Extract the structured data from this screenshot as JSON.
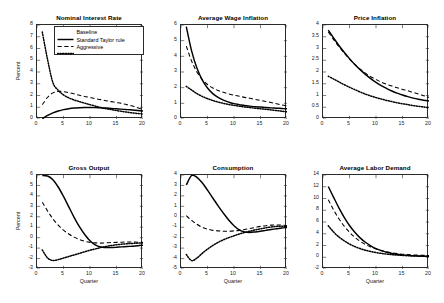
{
  "figure": {
    "background": "#ffffff",
    "line_color": "#000000",
    "axis_color": "#2b2b2b"
  },
  "legend": {
    "position": "top-right-of-panel-1",
    "entries": [
      {
        "label": "Baseline",
        "style": "solid"
      },
      {
        "label": "Standard Taylor rule",
        "style": "dashed"
      },
      {
        "label": "Aggressive",
        "style": "dotted"
      }
    ]
  },
  "axis_labels": {
    "y": "Percent",
    "x": "Quarter"
  },
  "chart_data": [
    {
      "type": "line",
      "title": "Nominal Interest Rate",
      "xlabel": "",
      "ylabel": "Percent",
      "xlim": [
        0,
        20
      ],
      "ylim": [
        0,
        8
      ],
      "xticks": [
        0,
        5,
        10,
        15,
        20
      ],
      "yticks": [
        0,
        1,
        2,
        3,
        4,
        5,
        6,
        7,
        8
      ],
      "grid": false,
      "x": [
        1,
        2,
        3,
        4,
        5,
        6,
        7,
        8,
        9,
        10,
        11,
        12,
        13,
        14,
        15,
        16,
        17,
        18,
        19,
        20
      ],
      "series": [
        {
          "name": "Baseline",
          "style": "solid",
          "values": [
            0.02,
            0.3,
            0.52,
            0.68,
            0.8,
            0.88,
            0.93,
            0.96,
            0.98,
            0.98,
            0.97,
            0.95,
            0.93,
            0.9,
            0.87,
            0.84,
            0.8,
            0.76,
            0.72,
            0.68
          ]
        },
        {
          "name": "Standard Taylor rule",
          "style": "dashed",
          "values": [
            1.22,
            1.85,
            2.22,
            2.35,
            2.33,
            2.25,
            2.14,
            2.02,
            1.92,
            1.83,
            1.73,
            1.65,
            1.56,
            1.48,
            1.4,
            1.32,
            1.22,
            1.1,
            0.95,
            0.8
          ]
        },
        {
          "name": "Aggressive",
          "style": "dotted",
          "values": [
            7.4,
            5.05,
            3.1,
            2.45,
            2.05,
            1.8,
            1.62,
            1.48,
            1.35,
            1.22,
            1.1,
            0.98,
            0.88,
            0.8,
            0.72,
            0.65,
            0.58,
            0.52,
            0.47,
            0.43
          ]
        }
      ]
    },
    {
      "type": "line",
      "title": "Average Wage Inflation",
      "xlabel": "",
      "ylabel": "",
      "xlim": [
        0,
        20
      ],
      "ylim": [
        0,
        6
      ],
      "xticks": [
        0,
        5,
        10,
        15,
        20
      ],
      "yticks": [
        0,
        1,
        2,
        3,
        4,
        5,
        6
      ],
      "grid": false,
      "x": [
        1,
        2,
        3,
        4,
        5,
        6,
        7,
        8,
        9,
        10,
        11,
        12,
        13,
        14,
        15,
        16,
        17,
        18,
        19,
        20
      ],
      "series": [
        {
          "name": "Baseline",
          "style": "solid",
          "values": [
            5.9,
            4.35,
            3.25,
            2.5,
            1.98,
            1.62,
            1.38,
            1.2,
            1.08,
            0.98,
            0.92,
            0.86,
            0.82,
            0.78,
            0.76,
            0.73,
            0.71,
            0.69,
            0.67,
            0.65
          ]
        },
        {
          "name": "Standard Taylor rule",
          "style": "dashed",
          "values": [
            4.65,
            3.7,
            3.0,
            2.52,
            2.2,
            1.98,
            1.82,
            1.7,
            1.6,
            1.52,
            1.45,
            1.38,
            1.32,
            1.25,
            1.18,
            1.12,
            1.05,
            0.98,
            0.9,
            0.82
          ]
        },
        {
          "name": "Aggressive",
          "style": "dotted",
          "values": [
            2.08,
            1.85,
            1.62,
            1.44,
            1.3,
            1.18,
            1.08,
            1.0,
            0.93,
            0.87,
            0.82,
            0.77,
            0.73,
            0.69,
            0.65,
            0.62,
            0.58,
            0.54,
            0.5,
            0.46
          ]
        }
      ]
    },
    {
      "type": "line",
      "title": "Price Inflation",
      "xlabel": "",
      "ylabel": "",
      "xlim": [
        0,
        20
      ],
      "ylim": [
        0,
        4
      ],
      "xticks": [
        0,
        5,
        10,
        15,
        20
      ],
      "yticks": [
        0,
        0.5,
        1,
        1.5,
        2,
        2.5,
        3,
        3.5,
        4
      ],
      "grid": false,
      "x": [
        1,
        2,
        3,
        4,
        5,
        6,
        7,
        8,
        9,
        10,
        11,
        12,
        13,
        14,
        15,
        16,
        17,
        18,
        19,
        20
      ],
      "series": [
        {
          "name": "Baseline",
          "style": "solid",
          "values": [
            3.78,
            3.45,
            3.13,
            2.84,
            2.57,
            2.32,
            2.1,
            1.9,
            1.72,
            1.56,
            1.42,
            1.3,
            1.19,
            1.1,
            1.02,
            0.95,
            0.89,
            0.84,
            0.8,
            0.77
          ]
        },
        {
          "name": "Standard Taylor rule",
          "style": "dashed",
          "values": [
            3.7,
            3.38,
            3.08,
            2.8,
            2.55,
            2.32,
            2.12,
            1.95,
            1.8,
            1.68,
            1.57,
            1.48,
            1.4,
            1.33,
            1.26,
            1.2,
            1.13,
            1.06,
            0.99,
            0.92
          ]
        },
        {
          "name": "Aggressive",
          "style": "dotted",
          "values": [
            1.82,
            1.7,
            1.58,
            1.46,
            1.35,
            1.25,
            1.15,
            1.06,
            0.98,
            0.91,
            0.85,
            0.79,
            0.74,
            0.69,
            0.65,
            0.61,
            0.57,
            0.54,
            0.51,
            0.48
          ]
        }
      ]
    },
    {
      "type": "line",
      "title": "Gross Output",
      "xlabel": "Quarter",
      "ylabel": "Percent",
      "xlim": [
        0,
        20
      ],
      "ylim": [
        -3,
        6
      ],
      "xticks": [
        0,
        5,
        10,
        15,
        20
      ],
      "yticks": [
        -3,
        -2,
        -1,
        0,
        1,
        2,
        3,
        4,
        5,
        6
      ],
      "grid": false,
      "x": [
        1,
        2,
        3,
        4,
        5,
        6,
        7,
        8,
        9,
        10,
        11,
        12,
        13,
        14,
        15,
        16,
        17,
        18,
        19,
        20
      ],
      "series": [
        {
          "name": "Baseline",
          "style": "solid",
          "values": [
            5.95,
            5.9,
            5.55,
            4.85,
            3.95,
            2.95,
            1.95,
            1.05,
            0.3,
            -0.3,
            -0.7,
            -0.9,
            -0.95,
            -0.95,
            -0.92,
            -0.88,
            -0.85,
            -0.82,
            -0.78,
            -0.72
          ]
        },
        {
          "name": "Standard Taylor rule",
          "style": "dashed",
          "values": [
            3.4,
            2.55,
            1.8,
            1.2,
            0.72,
            0.35,
            0.05,
            -0.18,
            -0.35,
            -0.45,
            -0.5,
            -0.52,
            -0.5,
            -0.47,
            -0.45,
            -0.43,
            -0.42,
            -0.42,
            -0.43,
            -0.45
          ]
        },
        {
          "name": "Aggressive",
          "style": "dotted",
          "values": [
            -1.18,
            -1.95,
            -2.18,
            -2.1,
            -1.95,
            -1.8,
            -1.65,
            -1.5,
            -1.35,
            -1.2,
            -1.08,
            -0.95,
            -0.85,
            -0.75,
            -0.68,
            -0.62,
            -0.58,
            -0.55,
            -0.52,
            -0.5
          ]
        }
      ]
    },
    {
      "type": "line",
      "title": "Consumption",
      "xlabel": "Quarter",
      "ylabel": "",
      "xlim": [
        0,
        20
      ],
      "ylim": [
        -5,
        4
      ],
      "xticks": [
        0,
        5,
        10,
        15,
        20
      ],
      "yticks": [
        -5,
        -4,
        -3,
        -2,
        -1,
        0,
        1,
        2,
        3,
        4
      ],
      "grid": false,
      "x": [
        1,
        2,
        3,
        4,
        5,
        6,
        7,
        8,
        9,
        10,
        11,
        12,
        13,
        14,
        15,
        16,
        17,
        18,
        19,
        20
      ],
      "series": [
        {
          "name": "Baseline",
          "style": "solid",
          "values": [
            3.05,
            3.95,
            3.78,
            3.25,
            2.55,
            1.8,
            1.05,
            0.35,
            -0.3,
            -0.85,
            -1.25,
            -1.45,
            -1.5,
            -1.45,
            -1.38,
            -1.3,
            -1.22,
            -1.15,
            -1.08,
            -1.02
          ]
        },
        {
          "name": "Standard Taylor rule",
          "style": "dashed",
          "values": [
            0.1,
            -0.35,
            -0.72,
            -1.0,
            -1.18,
            -1.3,
            -1.35,
            -1.38,
            -1.38,
            -1.35,
            -1.3,
            -1.22,
            -1.12,
            -1.02,
            -0.92,
            -0.85,
            -0.8,
            -0.78,
            -0.8,
            -0.85
          ]
        },
        {
          "name": "Aggressive",
          "style": "dotted",
          "values": [
            -3.62,
            -4.2,
            -3.95,
            -3.5,
            -3.1,
            -2.75,
            -2.45,
            -2.2,
            -2.0,
            -1.82,
            -1.65,
            -1.5,
            -1.38,
            -1.25,
            -1.15,
            -1.05,
            -0.98,
            -0.92,
            -0.9,
            -0.92
          ]
        }
      ]
    },
    {
      "type": "line",
      "title": "Average Labor Demand",
      "xlabel": "Quarter",
      "ylabel": "",
      "xlim": [
        0,
        20
      ],
      "ylim": [
        -2,
        14
      ],
      "xticks": [
        0,
        5,
        10,
        15,
        20
      ],
      "yticks": [
        -2,
        0,
        2,
        4,
        6,
        8,
        10,
        12,
        14
      ],
      "grid": false,
      "x": [
        1,
        2,
        3,
        4,
        5,
        6,
        7,
        8,
        9,
        10,
        11,
        12,
        13,
        14,
        15,
        16,
        17,
        18,
        19,
        20
      ],
      "series": [
        {
          "name": "Baseline",
          "style": "solid",
          "values": [
            12.05,
            10.2,
            8.4,
            6.8,
            5.4,
            4.25,
            3.3,
            2.55,
            1.95,
            1.48,
            1.12,
            0.85,
            0.65,
            0.5,
            0.4,
            0.32,
            0.26,
            0.22,
            0.18,
            0.15
          ]
        },
        {
          "name": "Standard Taylor rule",
          "style": "dashed",
          "values": [
            9.8,
            8.05,
            6.55,
            5.3,
            4.25,
            3.4,
            2.72,
            2.18,
            1.75,
            1.4,
            1.12,
            0.92,
            0.75,
            0.62,
            0.52,
            0.45,
            0.4,
            0.36,
            0.32,
            0.3
          ]
        },
        {
          "name": "Aggressive",
          "style": "dotted",
          "values": [
            5.35,
            4.3,
            3.45,
            2.8,
            2.25,
            1.82,
            1.48,
            1.2,
            0.98,
            0.8,
            0.65,
            0.54,
            0.44,
            0.37,
            0.31,
            0.26,
            0.22,
            0.19,
            0.16,
            0.14
          ]
        }
      ]
    }
  ]
}
